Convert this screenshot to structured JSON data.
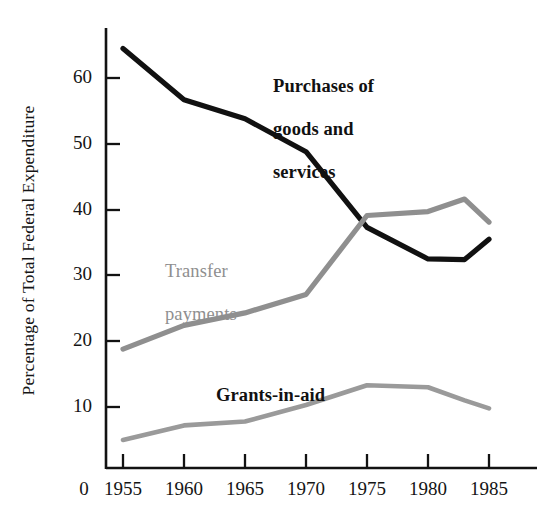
{
  "chart_data": {
    "type": "line",
    "title": "",
    "xlabel": "",
    "ylabel": "Percentage of Total Federal Expenditure",
    "x": [
      1955,
      1960,
      1965,
      1970,
      1975,
      1980,
      1983,
      1985
    ],
    "xlim": [
      1953.0,
      1986.5
    ],
    "ylim": [
      0,
      68
    ],
    "xtick_labels": [
      "0",
      "1955",
      "1960",
      "1965",
      "1970",
      "1975",
      "1980",
      "1985"
    ],
    "xtick_values": [
      null,
      1955,
      1960,
      1965,
      1970,
      1975,
      1980,
      1985
    ],
    "ytick_labels": [
      "10",
      "20",
      "30",
      "40",
      "50",
      "60"
    ],
    "ytick_values": [
      10,
      20,
      30,
      40,
      50,
      60
    ],
    "grid": false,
    "legend": "inline-annotations",
    "series": [
      {
        "name": "Purchases of goods and services",
        "label_text": "Purchases of\ngoods and\nservices",
        "color": "#111111",
        "x": [
          1955,
          1960,
          1965,
          1970,
          1975,
          1980,
          1983,
          1985
        ],
        "values": [
          64.5,
          56.7,
          53.8,
          48.8,
          37.3,
          32.5,
          32.4,
          35.5
        ]
      },
      {
        "name": "Transfer payments",
        "label_text": "Transfer\npayments",
        "color": "#8f8f8f",
        "x": [
          1955,
          1960,
          1965,
          1970,
          1975,
          1980,
          1983,
          1985
        ],
        "values": [
          18.8,
          22.4,
          24.3,
          27.1,
          39.1,
          39.7,
          41.6,
          38.1
        ]
      },
      {
        "name": "Grants-in-aid",
        "label_text": "Grants-in-aid",
        "color": "#9a9a9a",
        "x": [
          1955,
          1960,
          1965,
          1970,
          1975,
          1980,
          1983,
          1985
        ],
        "values": [
          5.0,
          7.2,
          7.8,
          10.3,
          13.3,
          13.0,
          11.0,
          9.8
        ]
      }
    ]
  },
  "axis": {
    "y_title": "Percentage of Total Federal Expenditure",
    "y_ticks": [
      "60",
      "50",
      "40",
      "30",
      "20",
      "10"
    ],
    "x_ticks": [
      "0",
      "1955",
      "1960",
      "1965",
      "1970",
      "1975",
      "1980",
      "1985"
    ]
  },
  "annotations": {
    "purchases": {
      "line1": "Purchases of",
      "line2": "goods and",
      "line3": "services"
    },
    "transfer": {
      "line1": "Transfer",
      "line2": "payments"
    },
    "grants": {
      "line1": "Grants-in-aid"
    }
  }
}
